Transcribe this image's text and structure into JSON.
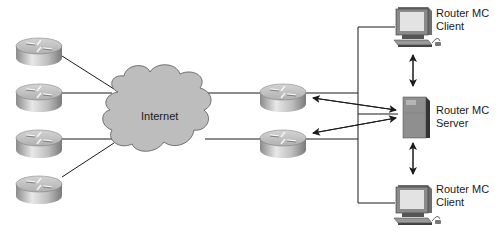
{
  "cloud": {
    "label": "Internet"
  },
  "remote_routers": [
    {
      "id": "router-1"
    },
    {
      "id": "router-2"
    },
    {
      "id": "router-3"
    },
    {
      "id": "router-4"
    }
  ],
  "edge_routers": [
    {
      "id": "edge-router-1"
    },
    {
      "id": "edge-router-2"
    }
  ],
  "nodes": {
    "client_top": {
      "line1": "Router MC",
      "line2": "Client"
    },
    "server": {
      "line1": "Router MC",
      "line2": "Server"
    },
    "client_bottom": {
      "line1": "Router MC",
      "line2": "Client"
    }
  },
  "colors": {
    "line": "#1a1a1a",
    "cloud_fill": "#bdbdbd",
    "router_top": "#c9c9c9",
    "router_side": "#9a9a9a",
    "server_fill": "#8f8f8f",
    "monitor_screen": "#e6e6e6"
  }
}
